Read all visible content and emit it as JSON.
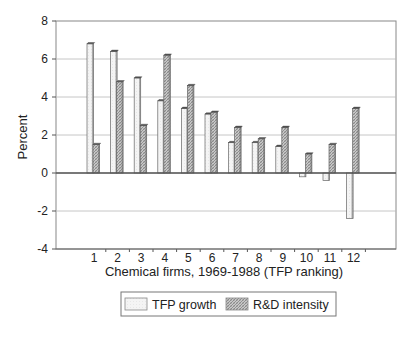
{
  "chart_data": {
    "type": "bar",
    "title": "",
    "xlabel": "Chemical firms, 1969-1988 (TFP ranking)",
    "ylabel": "Percent",
    "ylim": [
      -4,
      8
    ],
    "yticks": [
      -4,
      -2,
      0,
      2,
      4,
      6,
      8
    ],
    "grid": true,
    "legend_position": "bottom",
    "categories": [
      "1",
      "2",
      "3",
      "4",
      "5",
      "6",
      "7",
      "8",
      "9",
      "10",
      "11",
      "12"
    ],
    "series": [
      {
        "name": "TFP growth",
        "fill": "#f2f2f2",
        "values": [
          6.8,
          6.4,
          5.0,
          3.8,
          3.4,
          3.1,
          1.6,
          1.6,
          1.4,
          -0.2,
          -0.4,
          -2.4
        ]
      },
      {
        "name": "R&D intensity",
        "fill": "#b5b5b5",
        "values": [
          1.5,
          4.8,
          2.5,
          6.2,
          4.6,
          3.2,
          2.4,
          1.8,
          2.4,
          1.0,
          1.5,
          3.4
        ]
      }
    ]
  },
  "legend": {
    "items": [
      {
        "label": "TFP growth"
      },
      {
        "label": "R&D intensity"
      }
    ]
  }
}
